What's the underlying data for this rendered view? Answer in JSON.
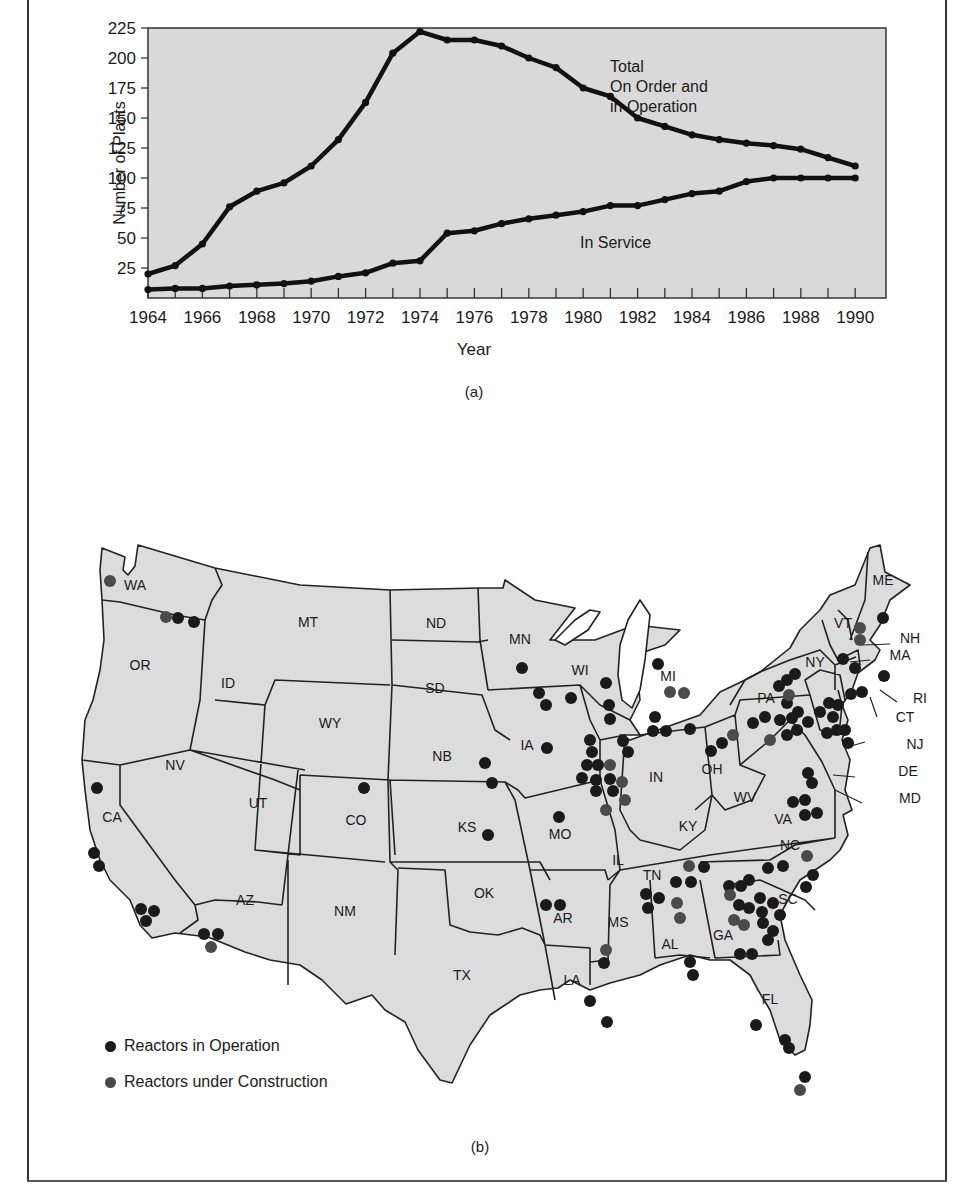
{
  "chart_data": [
    {
      "type": "line",
      "panel": "(a)",
      "title": "",
      "xlabel": "Year",
      "ylabel": "Number of Plants",
      "x": [
        1964,
        1965,
        1966,
        1967,
        1968,
        1969,
        1970,
        1971,
        1972,
        1973,
        1974,
        1975,
        1976,
        1977,
        1978,
        1979,
        1980,
        1981,
        1982,
        1983,
        1984,
        1985,
        1986,
        1987,
        1988,
        1989,
        1990
      ],
      "x_tick_labels": [
        "1964",
        "1966",
        "1968",
        "1970",
        "1972",
        "1974",
        "1976",
        "1978",
        "1980",
        "1982",
        "1984",
        "1986",
        "1988",
        "1990"
      ],
      "y_tick_labels": [
        "25",
        "50",
        "75",
        "100",
        "125",
        "150",
        "175",
        "200",
        "225"
      ],
      "ylim": [
        0,
        225
      ],
      "xlim": [
        1964,
        1990
      ],
      "grid": false,
      "background": "#d9d9d9",
      "series": [
        {
          "name": "Total On Order and in Operation",
          "label_lines": [
            "Total",
            "On Order and",
            "in Operation"
          ],
          "values": [
            20,
            27,
            45,
            76,
            89,
            96,
            110,
            132,
            163,
            204,
            222,
            215,
            215,
            210,
            200,
            192,
            175,
            168,
            150,
            143,
            136,
            132,
            129,
            127,
            124,
            117,
            110
          ]
        },
        {
          "name": "In Service",
          "label_lines": [
            "In Service"
          ],
          "values": [
            7,
            8,
            8,
            10,
            11,
            12,
            14,
            18,
            21,
            29,
            31,
            54,
            56,
            62,
            66,
            69,
            72,
            77,
            77,
            82,
            87,
            89,
            97,
            100,
            100,
            100,
            100
          ]
        }
      ]
    },
    {
      "type": "map",
      "panel": "(b)",
      "title": "",
      "legend": [
        {
          "label": "Reactors in Operation",
          "color": "#1a1a1a"
        },
        {
          "label": "Reactors under Construction",
          "color": "#4a4a4a"
        }
      ],
      "states": [
        "WA",
        "OR",
        "CA",
        "ID",
        "NV",
        "MT",
        "WY",
        "UT",
        "AZ",
        "CO",
        "NM",
        "ND",
        "SD",
        "NB",
        "KS",
        "OK",
        "TX",
        "MN",
        "IA",
        "MO",
        "AR",
        "LA",
        "WI",
        "IL",
        "MI",
        "IN",
        "OH",
        "KY",
        "TN",
        "MS",
        "AL",
        "GA",
        "FL",
        "SC",
        "NC",
        "VA",
        "WV",
        "PA",
        "NY",
        "VT",
        "NH",
        "ME",
        "MA",
        "RI",
        "CT",
        "NJ",
        "DE",
        "MD"
      ],
      "reactors_in_operation_approx_by_state": {
        "WA": 3,
        "CA": 6,
        "AZ": 2,
        "CO": 1,
        "NB": 2,
        "KS": 1,
        "MN": 3,
        "IA": 1,
        "MO": 1,
        "AR": 2,
        "LA": 2,
        "MS": 1,
        "WI": 4,
        "IL": 12,
        "MI": 5,
        "OH": 2,
        "TN": 3,
        "AL": 5,
        "GA": 2,
        "SC": 10,
        "NC": 4,
        "VA": 6,
        "PA": 10,
        "NY": 5,
        "VT": 1,
        "ME": 1,
        "MA": 2,
        "CT": 3,
        "NJ": 4,
        "FL": 4,
        "MD": 2
      },
      "reactors_under_construction_approx_by_state": {
        "WA": 2,
        "AZ": 1,
        "IL": 4,
        "MI": 2,
        "OH": 1,
        "TN": 1,
        "AL": 2,
        "GA": 3,
        "MS": 1,
        "NC": 1,
        "NY": 1,
        "NH": 2,
        "PA": 1
      }
    }
  ],
  "captions": {
    "a": "(a)",
    "b": "(b)"
  },
  "legend": {
    "operation": "Reactors in Operation",
    "construction": "Reactors under Construction"
  },
  "colors": {
    "plot_bg": "#d9d9d9",
    "state_fill": "#dcdcdc",
    "line": "#111111",
    "dot_operation": "#1a1a1a",
    "dot_construction": "#4a4a4a"
  }
}
